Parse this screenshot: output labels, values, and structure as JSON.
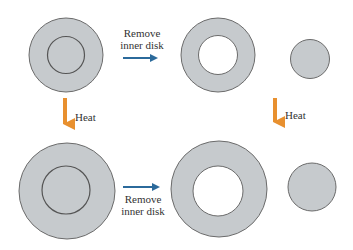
{
  "colors": {
    "disk_fill": "#c6cacd",
    "disk_stroke": "#6b6b6b",
    "arrow_blue": "#2b6a9b",
    "arrow_orange": "#e8902f",
    "text": "#333333",
    "background": "#ffffff"
  },
  "labels": {
    "top_arrow_line1": "Remove",
    "top_arrow_line2": "inner disk",
    "bottom_arrow_line1": "Remove",
    "bottom_arrow_line2": "inner disk",
    "left_heat": "Heat",
    "right_heat": "Heat"
  },
  "shapes": {
    "top_full_disk": {
      "cx": 66,
      "cy": 55,
      "r": 37,
      "inner_r": 18.5
    },
    "top_ring": {
      "cx": 218,
      "cy": 55,
      "r": 37,
      "hole_r": 19.5
    },
    "top_small_disk": {
      "cx": 310,
      "cy": 59,
      "r": 19.5
    },
    "bottom_full_disk": {
      "cx": 67,
      "cy": 191,
      "r": 48,
      "inner_r": 24
    },
    "bottom_ring": {
      "cx": 219,
      "cy": 189,
      "r": 48,
      "hole_r": 25
    },
    "bottom_small_disk": {
      "cx": 312,
      "cy": 187,
      "r": 24
    }
  }
}
